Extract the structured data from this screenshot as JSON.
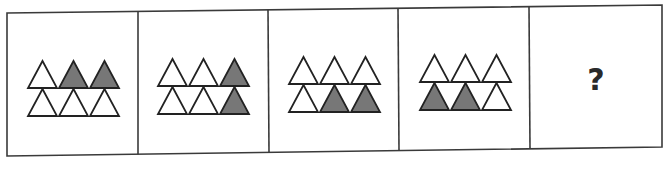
{
  "puzzle": {
    "panel_count": 5,
    "colors": {
      "background": "#ffffff",
      "border": "#3a3a3a",
      "stroke": "#222222",
      "filled": "#777777",
      "empty": "#ffffff",
      "question_mark": "#2a2a2a"
    },
    "frame": {
      "top_left": [
        7,
        13
      ],
      "top_right": [
        662,
        5
      ],
      "bottom_right": [
        662,
        147
      ],
      "bottom_left": [
        7,
        156
      ]
    },
    "dividers": [
      {
        "x_top": 138,
        "x_bottom": 138
      },
      {
        "x_top": 268,
        "x_bottom": 269
      },
      {
        "x_top": 398,
        "x_bottom": 399
      },
      {
        "x_top": 529,
        "x_bottom": 530
      }
    ],
    "panels": [
      {
        "label": "panel-1",
        "origin": [
          28,
          61
        ],
        "rows": [
          [
            "empty",
            "filled",
            "filled"
          ],
          [
            "empty",
            "empty",
            "empty"
          ]
        ]
      },
      {
        "label": "panel-2",
        "origin": [
          158,
          59
        ],
        "rows": [
          [
            "empty",
            "empty",
            "filled"
          ],
          [
            "empty",
            "empty",
            "filled"
          ]
        ]
      },
      {
        "label": "panel-3",
        "origin": [
          289,
          57
        ],
        "rows": [
          [
            "empty",
            "empty",
            "empty"
          ],
          [
            "empty",
            "filled",
            "filled"
          ]
        ]
      },
      {
        "label": "panel-4",
        "origin": [
          420,
          55
        ],
        "rows": [
          [
            "empty",
            "empty",
            "empty"
          ],
          [
            "filled",
            "filled",
            "empty"
          ]
        ]
      },
      {
        "label": "panel-5",
        "question": "?"
      }
    ],
    "triangle": {
      "width": 29,
      "height": 27,
      "col_step": 31,
      "row_step": 28
    },
    "question_position": [
      596,
      80
    ]
  }
}
